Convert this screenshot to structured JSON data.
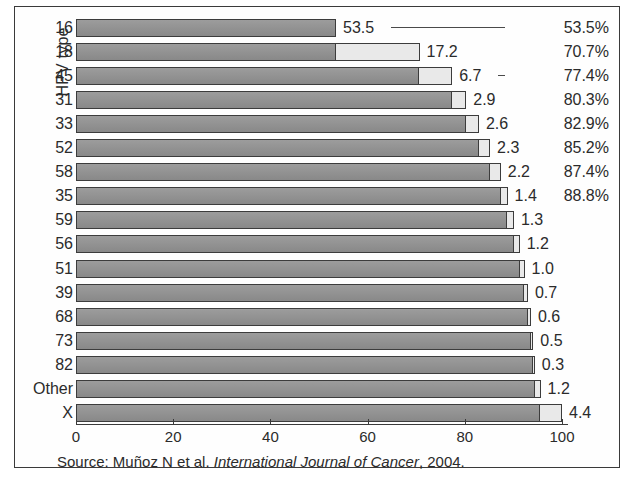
{
  "figure": {
    "y_axis_title": "HPV type",
    "source_prefix": "Source: Muñoz N et al. ",
    "source_journal": "International Journal of Cancer",
    "source_suffix": ", 2004.",
    "border_color": "#3a3a3a",
    "bar_dark_color": "#919191",
    "bar_light_color": "#e9e9e9",
    "bar_outline_color": "#3c3c3c"
  },
  "chart_data": {
    "type": "bar",
    "title": "",
    "subtitle": "",
    "xlabel": "",
    "ylabel": "HPV type",
    "xlim": [
      0,
      100
    ],
    "grid": false,
    "legend": null,
    "orientation": "horizontal",
    "note": "Horizontal cumulative bar chart. Each bar's dark portion is the cumulative percentage of the preceding HPV types; the light segment at its right end is the individual contribution of that row's type. Cumulative percentage labels are printed only for the first eight types.",
    "categories": [
      "16",
      "18",
      "45",
      "31",
      "33",
      "52",
      "58",
      "35",
      "59",
      "56",
      "51",
      "39",
      "68",
      "73",
      "82",
      "Other",
      "X"
    ],
    "values": [
      53.5,
      17.2,
      6.7,
      2.9,
      2.6,
      2.3,
      2.2,
      1.4,
      1.3,
      1.2,
      1.0,
      0.7,
      0.6,
      0.5,
      0.3,
      1.2,
      4.4
    ],
    "value_labels": [
      "53.5",
      "17.2",
      "6.7",
      "2.9",
      "2.6",
      "2.3",
      "2.2",
      "1.4",
      "1.3",
      "1.2",
      "1.0",
      "0.7",
      "0.6",
      "0.5",
      "0.3",
      "1.2",
      "4.4"
    ],
    "cumulative": [
      53.5,
      70.7,
      77.4,
      80.3,
      82.9,
      85.2,
      87.4,
      88.8,
      90.1,
      91.3,
      92.3,
      93.0,
      93.6,
      94.1,
      94.4,
      95.6,
      100.0
    ],
    "cumulative_labels": [
      "53.5%",
      "70.7%",
      "77.4%",
      "80.3%",
      "82.9%",
      "85.2%",
      "87.4%",
      "88.8%",
      "",
      "",
      "",
      "",
      "",
      "",
      "",
      "",
      ""
    ],
    "leader_line_rows": [
      "16",
      "45",
      "33",
      "58"
    ],
    "xticks": [
      0,
      20,
      40,
      60,
      80,
      100
    ],
    "xticklabels": [
      "0",
      "20",
      "40",
      "60",
      "80",
      "100"
    ],
    "series": [
      {
        "name": "Preceding cumulative (dark)",
        "values": [
          0.0,
          53.5,
          70.7,
          77.4,
          80.3,
          82.9,
          85.2,
          87.4,
          88.8,
          90.1,
          91.3,
          92.3,
          93.0,
          93.6,
          94.1,
          94.4,
          95.6
        ]
      },
      {
        "name": "Type contribution (light)",
        "values": [
          53.5,
          17.2,
          6.7,
          2.9,
          2.6,
          2.3,
          2.2,
          1.4,
          1.3,
          1.2,
          1.0,
          0.7,
          0.6,
          0.5,
          0.3,
          1.2,
          4.4
        ]
      }
    ]
  }
}
